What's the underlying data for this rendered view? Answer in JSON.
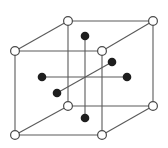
{
  "diagram": {
    "type": "crystal-lattice-unit-cell",
    "colors": {
      "edge": "#5a5a5a",
      "corner_fill": "#ffffff",
      "corner_stroke": "#4a4a4a",
      "face_dot": "#1e1e1e",
      "background": "#ffffff"
    },
    "corner_radius": 4.4,
    "face_radius": 4.3,
    "corners": [
      {
        "name": "front-top-left",
        "x": 15,
        "y": 51
      },
      {
        "name": "front-top-right",
        "x": 102,
        "y": 51
      },
      {
        "name": "front-bottom-left",
        "x": 15,
        "y": 135
      },
      {
        "name": "front-bottom-right",
        "x": 102,
        "y": 135
      },
      {
        "name": "back-top-left",
        "x": 68,
        "y": 21
      },
      {
        "name": "back-top-right",
        "x": 153,
        "y": 21
      },
      {
        "name": "back-bottom-left",
        "x": 68,
        "y": 106
      },
      {
        "name": "back-bottom-right",
        "x": 153,
        "y": 106
      }
    ],
    "face_centers": [
      {
        "name": "top",
        "x": 85,
        "y": 36
      },
      {
        "name": "bottom",
        "x": 85,
        "y": 118
      },
      {
        "name": "left",
        "x": 42,
        "y": 77
      },
      {
        "name": "right",
        "x": 127,
        "y": 77
      },
      {
        "name": "back",
        "x": 112,
        "y": 62
      },
      {
        "name": "front",
        "x": 57,
        "y": 93
      }
    ]
  }
}
